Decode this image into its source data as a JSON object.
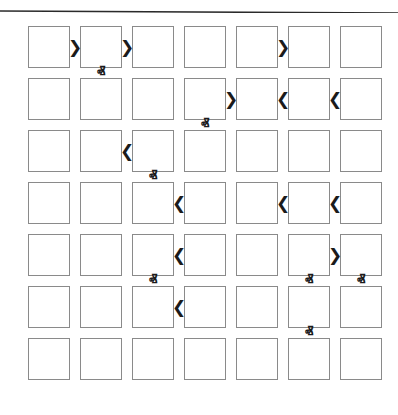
{
  "figure": {
    "kind": "grid-arrow-diagram",
    "background_color": "#ffffff",
    "top_rule": {
      "name": "horizontal-rule",
      "color": "#2a2a2a",
      "y_left": 11,
      "y_right": 13,
      "thickness": 1.6
    },
    "grid": {
      "columns": 7,
      "rows": 7,
      "cell_size": 42,
      "gap_x": 10,
      "gap_y": 10,
      "origin_x": 28,
      "origin_y": 26,
      "cell_border_color": "#8a8a8a",
      "cell_fill_color": "#ffffff",
      "cell_label": ""
    },
    "arrow_style": {
      "color": "#1b1b1b",
      "right_glyph": "❯",
      "left_glyph": "❮",
      "up_glyph": "ⱏ",
      "down_glyph": "ⱟ"
    },
    "horizontal_arrows": [
      {
        "row": 1,
        "from_col": 1,
        "to_col": 2,
        "direction": "right",
        "glyph": "❯"
      },
      {
        "row": 1,
        "from_col": 2,
        "to_col": 3,
        "direction": "right",
        "glyph": "❯"
      },
      {
        "row": 1,
        "from_col": 5,
        "to_col": 6,
        "direction": "right",
        "glyph": "❯"
      },
      {
        "row": 2,
        "from_col": 4,
        "to_col": 5,
        "direction": "right",
        "glyph": "❯"
      },
      {
        "row": 2,
        "from_col": 6,
        "to_col": 5,
        "direction": "left",
        "glyph": "❮"
      },
      {
        "row": 2,
        "from_col": 7,
        "to_col": 6,
        "direction": "left",
        "glyph": "❮"
      },
      {
        "row": 3,
        "from_col": 3,
        "to_col": 2,
        "direction": "left",
        "glyph": "❮"
      },
      {
        "row": 4,
        "from_col": 4,
        "to_col": 3,
        "direction": "left",
        "glyph": "❮"
      },
      {
        "row": 4,
        "from_col": 6,
        "to_col": 5,
        "direction": "left",
        "glyph": "❮"
      },
      {
        "row": 4,
        "from_col": 7,
        "to_col": 6,
        "direction": "left",
        "glyph": "❮"
      },
      {
        "row": 5,
        "from_col": 4,
        "to_col": 3,
        "direction": "left",
        "glyph": "❮"
      },
      {
        "row": 5,
        "from_col": 6,
        "to_col": 7,
        "direction": "right",
        "glyph": "❯"
      },
      {
        "row": 6,
        "from_col": 4,
        "to_col": 3,
        "direction": "left",
        "glyph": "❮"
      }
    ],
    "vertical_arrows": [
      {
        "col": 2,
        "from_row": 2,
        "to_row": 1,
        "direction": "up",
        "glyph": "ⱏ"
      },
      {
        "col": 3,
        "from_row": 1,
        "to_row": 2,
        "direction": "down",
        "glyph": "ⱟ"
      },
      {
        "col": 7,
        "from_row": 1,
        "to_row": 2,
        "direction": "down",
        "glyph": "ⱟ"
      },
      {
        "col": 4,
        "from_row": 3,
        "to_row": 2,
        "direction": "up",
        "glyph": "ⱏ"
      },
      {
        "col": 3,
        "from_row": 4,
        "to_row": 3,
        "direction": "up",
        "glyph": "ⱏ"
      },
      {
        "col": 4,
        "from_row": 4,
        "to_row": 5,
        "direction": "down",
        "glyph": "ⱟ"
      },
      {
        "col": 3,
        "from_row": 6,
        "to_row": 5,
        "direction": "up",
        "glyph": "ⱏ"
      },
      {
        "col": 6,
        "from_row": 6,
        "to_row": 5,
        "direction": "up",
        "glyph": "ⱏ"
      },
      {
        "col": 7,
        "from_row": 6,
        "to_row": 5,
        "direction": "up",
        "glyph": "ⱏ"
      },
      {
        "col": 1,
        "from_row": 7,
        "to_row": 6,
        "direction": "down",
        "glyph": "ⱟ"
      },
      {
        "col": 2,
        "from_row": 7,
        "to_row": 6,
        "direction": "down",
        "glyph": "ⱟ"
      },
      {
        "col": 6,
        "from_row": 7,
        "to_row": 6,
        "direction": "up",
        "glyph": "ⱏ"
      }
    ]
  }
}
